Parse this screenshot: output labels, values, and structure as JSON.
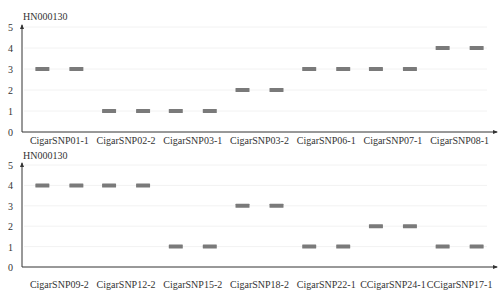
{
  "chart_data": [
    {
      "type": "scatter",
      "title": "HN000130",
      "xlabel": "",
      "ylabel": "",
      "ylim": [
        0,
        5
      ],
      "yticks": [
        0,
        1,
        2,
        3,
        4,
        5
      ],
      "grid": false,
      "marker": "horizontal-bar",
      "marker_color": "#7a7a7a",
      "categories": [
        "CigarSNP01-1",
        "CigarSNP02-2",
        "CigarSNP03-1",
        "CigarSNP03-2",
        "CigarSNP06-1",
        "CigarSNP07-1",
        "CigarSNP08-1"
      ],
      "series": [
        {
          "name": "allele-1",
          "values": [
            3,
            1,
            1,
            2,
            3,
            3,
            4
          ]
        },
        {
          "name": "allele-2",
          "values": [
            3,
            1,
            1,
            2,
            3,
            3,
            4
          ]
        }
      ],
      "points": [
        3,
        3,
        1,
        1,
        1,
        1,
        2,
        2,
        3,
        3,
        3,
        3,
        4,
        4
      ]
    },
    {
      "type": "scatter",
      "title": "HN000130",
      "xlabel": "",
      "ylabel": "",
      "ylim": [
        0,
        5
      ],
      "yticks": [
        0,
        1,
        2,
        3,
        4,
        5
      ],
      "grid": false,
      "marker": "horizontal-bar",
      "marker_color": "#7a7a7a",
      "categories": [
        "CigarSNP09-2",
        "CigarSNP12-2",
        "CigarSNP15-2",
        "CigarSNP18-2",
        "CigarSNP22-1",
        "CCigarSNP24-1",
        "CCigarSNP17-1"
      ],
      "series": [
        {
          "name": "allele-1",
          "values": [
            4,
            4,
            1,
            3,
            1,
            2,
            1
          ]
        },
        {
          "name": "allele-2",
          "values": [
            4,
            4,
            1,
            3,
            1,
            2,
            1
          ]
        }
      ],
      "points": [
        4,
        4,
        4,
        4,
        1,
        1,
        3,
        3,
        1,
        1,
        2,
        2,
        1,
        1
      ]
    }
  ]
}
